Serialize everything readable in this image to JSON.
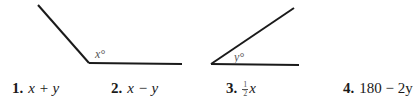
{
  "figures": [
    {
      "id": "angle-x",
      "angle_label": "x°",
      "lines": [
        {
          "x1": 38,
          "y1": 5,
          "x2": 89,
          "y2": 63
        },
        {
          "x1": 89,
          "y1": 63,
          "x2": 182,
          "y2": 64
        }
      ]
    },
    {
      "id": "angle-y",
      "angle_label": "y°",
      "lines": [
        {
          "x1": 211,
          "y1": 64,
          "x2": 294,
          "y2": 8
        },
        {
          "x1": 211,
          "y1": 64,
          "x2": 299,
          "y2": 65
        }
      ]
    }
  ],
  "choices": [
    {
      "number": "1.",
      "expression": "x + y"
    },
    {
      "number": "2.",
      "expression": "x − y"
    },
    {
      "number": "3.",
      "fraction": {
        "numerator": "1",
        "denominator": "2"
      },
      "expression": "x"
    },
    {
      "number": "4.",
      "expression": "180 − 2y"
    }
  ],
  "colors": {
    "line": "#1a1a1a",
    "label": "#555555"
  }
}
